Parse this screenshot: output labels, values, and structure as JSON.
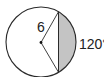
{
  "figure": {
    "type": "circle-segment",
    "radius_label": "6",
    "arc_label": "120°",
    "center_point": "center-dot",
    "shaded_region": "minor segment between chord and arc",
    "colors": {
      "stroke": "#2a2a2a",
      "shade": "#c4c4c4",
      "background": "#ffffff"
    }
  }
}
